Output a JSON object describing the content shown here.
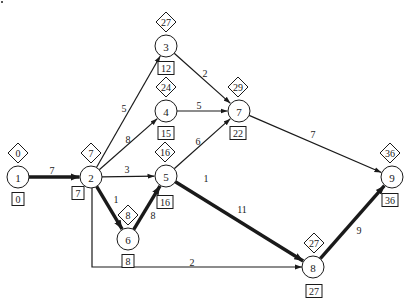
{
  "diagram": {
    "type": "activity-on-node network (critical path)",
    "colors": {
      "line": "#1a1a1a",
      "background": "#ffffff"
    },
    "nodes": [
      {
        "id": "1",
        "label": "1",
        "x": 18,
        "y": 177,
        "latest": "0",
        "earliest": "0",
        "dx": 0,
        "by": 0
      },
      {
        "id": "2",
        "label": "2",
        "x": 91,
        "y": 177,
        "latest": "7",
        "earliest": "7",
        "dx": 0,
        "by": -13
      },
      {
        "id": "3",
        "label": "3",
        "x": 166,
        "y": 46,
        "latest": "27",
        "earliest": "12",
        "dx": 0,
        "by": 0
      },
      {
        "id": "4",
        "label": "4",
        "x": 166,
        "y": 111,
        "latest": "24",
        "earliest": "15",
        "dx": 0,
        "by": 0
      },
      {
        "id": "5",
        "label": "5",
        "x": 166,
        "y": 176,
        "latest": "16",
        "earliest": "16",
        "dx": -1,
        "by": 4
      },
      {
        "id": "6",
        "label": "6",
        "x": 128,
        "y": 239,
        "latest": "8",
        "earliest": "8",
        "dx": 0,
        "by": 0
      },
      {
        "id": "7",
        "label": "7",
        "x": 239,
        "y": 111,
        "latest": "29",
        "earliest": "22",
        "dx": -1,
        "by": 0
      },
      {
        "id": "8",
        "label": "8",
        "x": 313,
        "y": 267,
        "latest": "27",
        "earliest": "27",
        "dx": 1,
        "by": 2
      },
      {
        "id": "9",
        "label": "9",
        "x": 392,
        "y": 177,
        "latest": "36",
        "earliest": "36",
        "dx": -2,
        "by": 1
      }
    ],
    "edges": [
      {
        "from": "1",
        "to": "2",
        "weight": "7",
        "critical": true,
        "label_x": 52,
        "label_y": 170
      },
      {
        "from": "2",
        "to": "3",
        "weight": "5",
        "critical": false,
        "label_x": 124,
        "label_y": 108
      },
      {
        "from": "2",
        "to": "4",
        "weight": "8",
        "critical": false,
        "label_x": 128,
        "label_y": 139
      },
      {
        "from": "2",
        "to": "5",
        "weight": "3",
        "critical": false,
        "label_x": 127,
        "label_y": 169
      },
      {
        "from": "2",
        "to": "6",
        "weight": "1",
        "critical": true,
        "label_x": 116,
        "label_y": 199
      },
      {
        "from": "6",
        "to": "5",
        "weight": "8",
        "critical": true,
        "label_x": 153,
        "label_y": 215
      },
      {
        "from": "3",
        "to": "7",
        "weight": "2",
        "critical": false,
        "label_x": 205,
        "label_y": 73
      },
      {
        "from": "4",
        "to": "7",
        "weight": "5",
        "critical": false,
        "label_x": 199,
        "label_y": 105
      },
      {
        "from": "5",
        "to": "7",
        "weight": "6",
        "critical": false,
        "label_x": 198,
        "label_y": 141
      },
      {
        "from": "5",
        "to": "8",
        "weight": "11",
        "critical": true,
        "label_x": 242,
        "label_y": 209
      },
      {
        "from": "7",
        "to": "9",
        "weight": "7",
        "critical": false,
        "label_x": 313,
        "label_y": 134
      },
      {
        "from": "8",
        "to": "9",
        "weight": "9",
        "critical": true,
        "label_x": 359,
        "label_y": 230
      },
      {
        "from": "2",
        "to": "8",
        "weight": "2",
        "critical": false,
        "label_x": 192,
        "label_y": 262,
        "routed": true
      }
    ],
    "stray_labels": [
      {
        "text": "1",
        "x": 206,
        "y": 178
      }
    ],
    "legend_hint": {
      "diamond": "latest time (top)",
      "box": "earliest time (bottom)"
    }
  }
}
